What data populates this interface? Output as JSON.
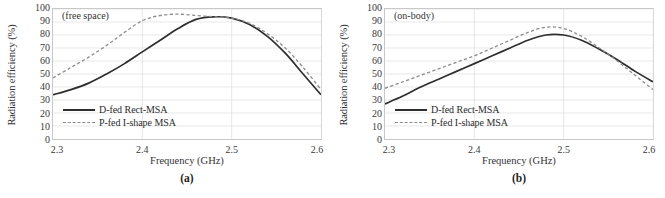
{
  "figure": {
    "panels": [
      {
        "subcaption": "(a)",
        "annotation": "(free space)",
        "chart_data": {
          "type": "line",
          "title": "(free space)",
          "xlabel": "Frequency (GHz)",
          "ylabel": "Radiation efficiency (%)",
          "xlim": [
            2.3,
            2.6
          ],
          "ylim": [
            0,
            100
          ],
          "xticks": [
            2.3,
            2.4,
            2.5,
            2.6
          ],
          "xtick_labels": [
            "2.3",
            "2.4",
            "2.5",
            "2.6"
          ],
          "yticks": [
            0,
            10,
            20,
            30,
            40,
            50,
            60,
            70,
            80,
            90,
            100
          ],
          "ytick_labels": [
            "0",
            "10",
            "20",
            "30",
            "40",
            "50",
            "60",
            "70",
            "80",
            "90",
            "100"
          ],
          "grid": true,
          "legend_position": "lower-left-inside",
          "series": [
            {
              "name": "D-fed Rect-MSA",
              "style": "solid",
              "color": "#2e2e2e",
              "x": [
                2.3,
                2.32,
                2.34,
                2.36,
                2.38,
                2.4,
                2.42,
                2.44,
                2.46,
                2.48,
                2.5,
                2.52,
                2.54,
                2.56,
                2.58,
                2.6
              ],
              "values": [
                34,
                38,
                43,
                50,
                58,
                67,
                76,
                85,
                92,
                94,
                93,
                88,
                79,
                66,
                50,
                34
              ]
            },
            {
              "name": "P-fed I-shape MSA",
              "style": "dashed",
              "color": "#8c8c8c",
              "x": [
                2.3,
                2.32,
                2.34,
                2.36,
                2.38,
                2.4,
                2.42,
                2.44,
                2.46,
                2.48,
                2.5,
                2.52,
                2.54,
                2.56,
                2.58,
                2.6
              ],
              "values": [
                47,
                55,
                63,
                72,
                82,
                91,
                95,
                96,
                95,
                94,
                93,
                89,
                81,
                70,
                55,
                38
              ]
            }
          ]
        }
      },
      {
        "subcaption": "(b)",
        "annotation": "(on-body)",
        "chart_data": {
          "type": "line",
          "title": "(on-body)",
          "xlabel": "Frequency (GHz)",
          "ylabel": "Radiation efficiency (%)",
          "xlim": [
            2.3,
            2.6
          ],
          "ylim": [
            0,
            100
          ],
          "xticks": [
            2.3,
            2.4,
            2.5,
            2.6
          ],
          "xtick_labels": [
            "2.3",
            "2.4",
            "2.5",
            "2.6"
          ],
          "yticks": [
            0,
            10,
            20,
            30,
            40,
            50,
            60,
            70,
            80,
            90,
            100
          ],
          "ytick_labels": [
            "0",
            "10",
            "20",
            "30",
            "40",
            "50",
            "60",
            "70",
            "80",
            "90",
            "100"
          ],
          "grid": true,
          "legend_position": "lower-left-inside",
          "series": [
            {
              "name": "D-fed Rect-MSA",
              "style": "solid",
              "color": "#2e2e2e",
              "x": [
                2.3,
                2.32,
                2.34,
                2.36,
                2.38,
                2.4,
                2.42,
                2.44,
                2.46,
                2.48,
                2.5,
                2.52,
                2.54,
                2.56,
                2.58,
                2.6
              ],
              "values": [
                27,
                33,
                40,
                46,
                52,
                58,
                64,
                70,
                76,
                80,
                80,
                76,
                69,
                61,
                52,
                44
              ]
            },
            {
              "name": "P-fed I-shape MSA",
              "style": "dashed",
              "color": "#8c8c8c",
              "x": [
                2.3,
                2.32,
                2.34,
                2.36,
                2.38,
                2.4,
                2.42,
                2.44,
                2.46,
                2.48,
                2.5,
                2.52,
                2.54,
                2.56,
                2.58,
                2.6
              ],
              "values": [
                39,
                44,
                49,
                54,
                59,
                64,
                70,
                76,
                82,
                86,
                85,
                79,
                70,
                60,
                49,
                38
              ]
            }
          ]
        }
      }
    ]
  }
}
